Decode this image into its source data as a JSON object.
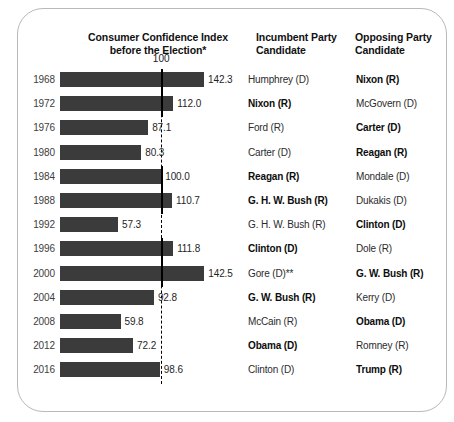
{
  "card": {
    "title_line1": "Consumer Confidence Index",
    "title_line2": "before the Election*",
    "col_incumbent_line1": "Incumbent Party",
    "col_incumbent_line2": "Candidate",
    "col_opposing_line1": "Opposing Party",
    "col_opposing_line2": "Candidate"
  },
  "reference": {
    "label": "100",
    "value": 100
  },
  "colors": {
    "bar": "#3b3b3b",
    "reference_line": "#000000",
    "year_text": "#3d3d3d",
    "card_border": "#b9b9b9"
  },
  "chart_data": {
    "type": "bar",
    "title": "Consumer Confidence Index before the Election*",
    "xlabel": "",
    "ylabel": "",
    "orientation": "horizontal",
    "xlim": [
      0,
      150
    ],
    "grid": false,
    "reference_line": 100,
    "reference_line_label": "100",
    "categories": [
      "1968",
      "1972",
      "1976",
      "1980",
      "1984",
      "1988",
      "1992",
      "1996",
      "2000",
      "2004",
      "2008",
      "2012",
      "2016"
    ],
    "values": [
      142.3,
      112.0,
      87.1,
      80.3,
      100.0,
      110.7,
      57.3,
      111.8,
      142.5,
      92.8,
      59.8,
      72.2,
      98.6
    ],
    "value_labels": [
      "142.3",
      "112.0",
      "87.1",
      "80.3",
      "100.0",
      "110.7",
      "57.3",
      "111.8",
      "142.5",
      "92.8",
      "59.8",
      "72.2",
      "98.6"
    ],
    "columns": [
      "Year",
      "Consumer Confidence Index before the Election*",
      "Incumbent Party Candidate",
      "Opposing Party Candidate"
    ],
    "rows": [
      {
        "year": "1968",
        "value": 142.3,
        "value_label": "142.3",
        "incumbent": "Humphrey (D)",
        "incumbent_won": false,
        "opposing": "Nixon (R)",
        "opposing_won": true
      },
      {
        "year": "1972",
        "value": 112.0,
        "value_label": "112.0",
        "incumbent": "Nixon (R)",
        "incumbent_won": true,
        "opposing": "McGovern (D)",
        "opposing_won": false
      },
      {
        "year": "1976",
        "value": 87.1,
        "value_label": "87.1",
        "incumbent": "Ford (R)",
        "incumbent_won": false,
        "opposing": "Carter (D)",
        "opposing_won": true
      },
      {
        "year": "1980",
        "value": 80.3,
        "value_label": "80.3",
        "incumbent": "Carter (D)",
        "incumbent_won": false,
        "opposing": "Reagan (R)",
        "opposing_won": true
      },
      {
        "year": "1984",
        "value": 100.0,
        "value_label": "100.0",
        "incumbent": "Reagan (R)",
        "incumbent_won": true,
        "opposing": "Mondale (D)",
        "opposing_won": false
      },
      {
        "year": "1988",
        "value": 110.7,
        "value_label": "110.7",
        "incumbent": "G. H. W. Bush (R)",
        "incumbent_won": true,
        "opposing": "Dukakis (D)",
        "opposing_won": false
      },
      {
        "year": "1992",
        "value": 57.3,
        "value_label": "57.3",
        "incumbent": "G. H. W. Bush (R)",
        "incumbent_won": false,
        "opposing": "Clinton (D)",
        "opposing_won": true
      },
      {
        "year": "1996",
        "value": 111.8,
        "value_label": "111.8",
        "incumbent": "Clinton (D)",
        "incumbent_won": true,
        "opposing": "Dole (R)",
        "opposing_won": false
      },
      {
        "year": "2000",
        "value": 142.5,
        "value_label": "142.5",
        "incumbent": "Gore (D)**",
        "incumbent_won": false,
        "opposing": "G. W. Bush (R)",
        "opposing_won": true
      },
      {
        "year": "2004",
        "value": 92.8,
        "value_label": "92.8",
        "incumbent": "G. W. Bush (R)",
        "incumbent_won": true,
        "opposing": "Kerry (D)",
        "opposing_won": false
      },
      {
        "year": "2008",
        "value": 59.8,
        "value_label": "59.8",
        "incumbent": "McCain (R)",
        "incumbent_won": false,
        "opposing": "Obama (D)",
        "opposing_won": true
      },
      {
        "year": "2012",
        "value": 72.2,
        "value_label": "72.2",
        "incumbent": "Obama (D)",
        "incumbent_won": true,
        "opposing": "Romney (R)",
        "opposing_won": false
      },
      {
        "year": "2016",
        "value": 98.6,
        "value_label": "98.6",
        "incumbent": "Clinton (D)",
        "incumbent_won": false,
        "opposing": "Trump (R)",
        "opposing_won": true
      }
    ]
  }
}
